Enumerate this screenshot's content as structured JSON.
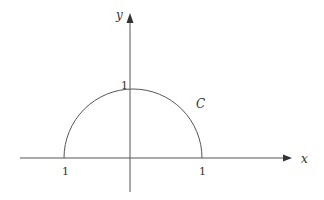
{
  "diagram": {
    "type": "semicircle-curve-on-axes",
    "colors": {
      "stroke": "#555555",
      "text": "#333333",
      "background": "#ffffff"
    },
    "axes": {
      "x_label": "x",
      "y_label": "y"
    },
    "ticks": {
      "x_left": "1",
      "x_right": "1",
      "y_top": "1"
    },
    "curve": {
      "label": "C",
      "shape": "upper semicircle",
      "radius": 1
    }
  }
}
